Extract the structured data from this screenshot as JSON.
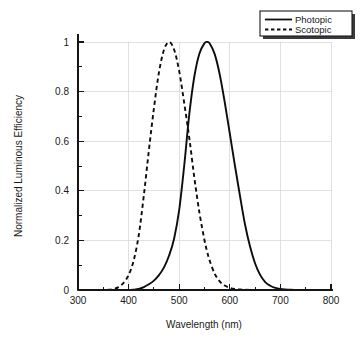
{
  "chart_data": {
    "type": "line",
    "title": "",
    "xlabel": "Wavelength  (nm)",
    "ylabel": "Normalized Luminous Efficiency",
    "xlim": [
      300,
      800
    ],
    "ylim": [
      0,
      1
    ],
    "xticks": [
      300,
      400,
      500,
      600,
      700,
      800
    ],
    "xticklabels": [
      "300",
      "400",
      "500",
      "600",
      "700",
      "800"
    ],
    "yticks": [
      0,
      0.2,
      0.4,
      0.6,
      0.8,
      1
    ],
    "yticklabels": [
      "0",
      "0.2",
      "0.4",
      "0.6",
      "0.8",
      "1"
    ],
    "x_minor_tick_step": 50,
    "y_minor_tick_step": 0.1,
    "grid": true,
    "grid_color": "#d8d8d8",
    "legend_position": "top-right",
    "line_color": "#0d0d0d",
    "background": "#ffffff",
    "x": [
      340,
      350,
      360,
      370,
      380,
      390,
      400,
      410,
      420,
      430,
      440,
      450,
      460,
      470,
      480,
      490,
      500,
      510,
      520,
      530,
      540,
      550,
      555,
      560,
      570,
      580,
      590,
      600,
      610,
      620,
      630,
      640,
      650,
      660,
      670,
      680,
      690,
      700,
      710,
      720,
      730,
      740,
      750,
      760,
      770,
      780
    ],
    "series": [
      {
        "name": "Photopic",
        "style": "solid",
        "peak_wavelength": 555,
        "values": [
          0.0,
          0.0,
          0.0,
          0.0,
          0.0,
          0.001,
          0.004,
          0.012,
          0.04,
          0.116,
          0.23,
          0.38,
          0.6,
          0.91,
          1.39,
          2.08,
          3.23,
          5.03,
          7.1,
          8.62,
          9.54,
          9.95,
          10.0,
          9.95,
          9.52,
          8.7,
          7.57,
          6.31,
          5.03,
          3.81,
          2.65,
          1.75,
          1.07,
          0.61,
          0.32,
          0.17,
          0.082,
          0.041,
          0.021,
          0.01,
          0.005,
          0.0025,
          0.0012,
          0.0006,
          0.0003,
          0.00015
        ],
        "scale_note": "values are percent-of-peak ×10; normalized peak = 1.0 at 555 nm"
      },
      {
        "name": "Scotopic",
        "style": "dashed",
        "peak_wavelength": 507,
        "values": [
          0.0,
          0.001,
          0.008,
          0.035,
          0.116,
          0.29,
          0.6,
          1.18,
          2.2,
          3.78,
          5.6,
          7.3,
          8.75,
          9.66,
          9.97,
          9.66,
          8.8,
          7.5,
          6.1,
          4.5,
          3.1,
          2.0,
          1.56,
          1.19,
          0.66,
          0.35,
          0.18,
          0.089,
          0.043,
          0.02,
          0.0095,
          0.0045,
          0.0021,
          0.001,
          0.0005,
          0.00025,
          0.00012,
          6e-05,
          3e-05,
          0.0,
          0.0,
          0.0,
          0.0,
          0.0,
          0.0,
          0.0
        ],
        "scale_note": "values are percent-of-peak ×10; normalized peak = 1.0 at 507 nm"
      }
    ]
  },
  "legend": {
    "entries": [
      {
        "label": "Photopic",
        "style": "solid"
      },
      {
        "label": "Scotopic",
        "style": "dashed"
      }
    ]
  },
  "axes": {
    "x_title": "Wavelength  (nm)",
    "y_title": "Normalized Luminous Efficiency"
  }
}
